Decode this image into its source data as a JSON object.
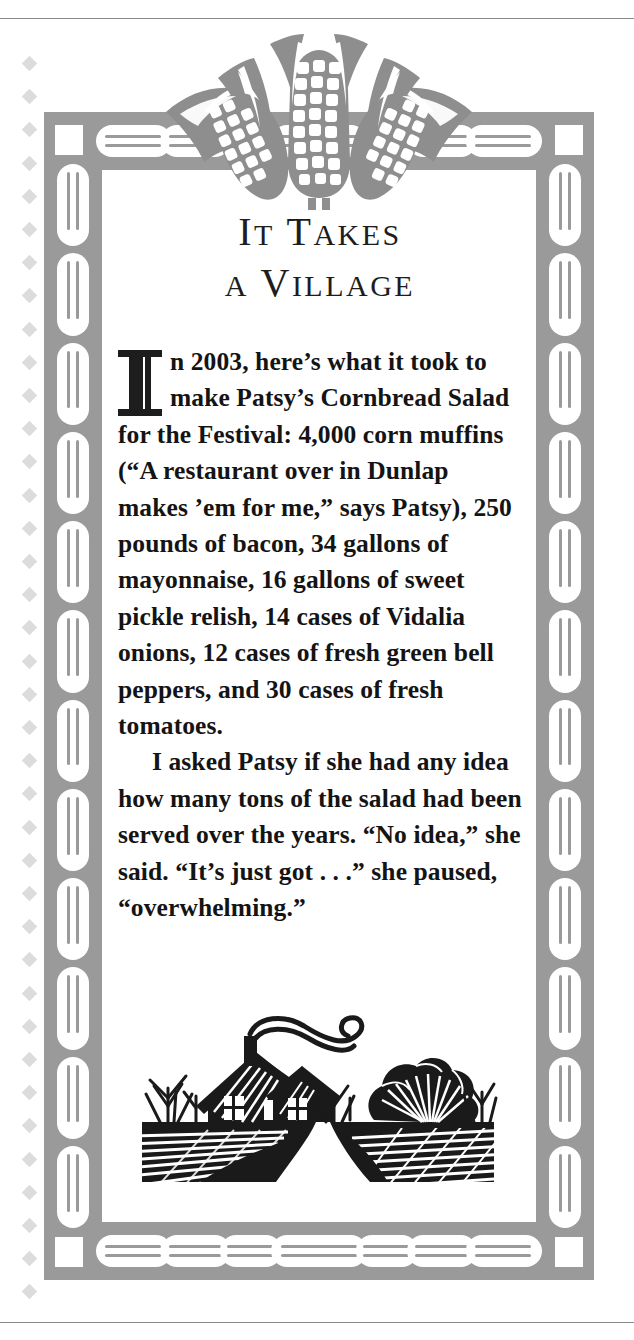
{
  "page": {
    "headline_lines": [
      "IT TAKES",
      "A VILLAGE"
    ],
    "dropcap": "I",
    "paragraphs": [
      "n 2003, here’s what it took to make Patsy’s Cornbread Salad for the Festival: 4,000 corn muffins (“A restaurant over in Dunlap makes ’em for me,” says Patsy), 250 pounds of bacon, 34 gallons of mayonnaise, 16 gallons of sweet pickle relish, 14 cases of Vidalia onions, 12 cases of fresh green bell peppers, and 30 cases of fresh tomatoes.",
      "I asked Patsy if she had any idea how many tons of the salad had been served over the years. “No idea,” she said. “It’s just got . . .” she paused, “overwhelming.”"
    ],
    "ornaments": {
      "top": "three-ears-of-corn-woodcut",
      "bottom": "farmhouse-landscape-woodcut",
      "border": "corn-kernel-capsule-border"
    },
    "colors": {
      "frame_gray": "#9a9a9a",
      "ornament_gray": "#8e8e8e",
      "diamond_gray": "#dcdcdc",
      "text_black": "#141414",
      "rule_gray": "#8a8a8a",
      "paper_white": "#ffffff"
    },
    "facts": {
      "year": "2003",
      "corn_muffins": "4,000",
      "bacon_pounds": "250",
      "mayonnaise_gallons": "34",
      "pickle_relish_gallons": "16",
      "vidalia_onion_cases": "14",
      "green_bell_pepper_cases": "12",
      "fresh_tomato_cases": "30"
    }
  }
}
